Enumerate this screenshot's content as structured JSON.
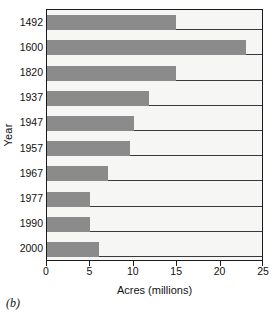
{
  "panel": {
    "label": "(b)"
  },
  "chart_data": {
    "type": "bar",
    "orientation": "horizontal",
    "title": "",
    "subtitle": "",
    "xlabel": "Acres (millions)",
    "ylabel": "Year",
    "categories": [
      "1492",
      "1600",
      "1820",
      "1937",
      "1947",
      "1957",
      "1967",
      "1977",
      "1990",
      "2000"
    ],
    "values": [
      14.9,
      22.9,
      14.9,
      11.7,
      10.0,
      9.6,
      7.0,
      5.0,
      5.0,
      6.0
    ],
    "xlim": [
      0,
      25
    ],
    "xticks": [
      0,
      5,
      10,
      15,
      20,
      25
    ],
    "xtick_labels": [
      "0",
      "5",
      "10",
      "15",
      "20",
      "25"
    ],
    "grid": false,
    "legend": null,
    "bar_color": "#8b8b8b",
    "plot_background": "#f6f6f4",
    "axis_color": "#1b1b1b",
    "row_line_color": "#3a3a3a"
  }
}
